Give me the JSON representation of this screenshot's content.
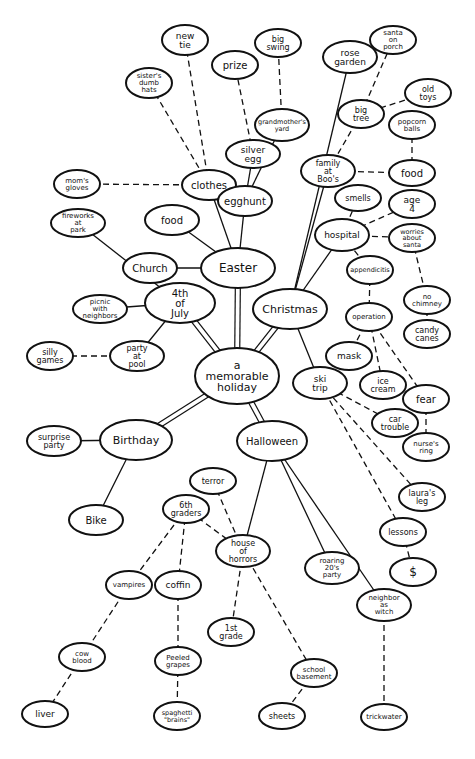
{
  "diagram": {
    "type": "mind-map",
    "center": "a memorable holiday",
    "nodes": [
      {
        "id": "center",
        "lines": [
          "a",
          "memorable",
          "holiday"
        ],
        "x": 237,
        "y": 376,
        "rx": 42,
        "ry": 28,
        "fs": 11
      },
      {
        "id": "easter",
        "lines": [
          "Easter"
        ],
        "x": 238,
        "y": 268,
        "rx": 37,
        "ry": 20,
        "fs": 12
      },
      {
        "id": "christmas",
        "lines": [
          "Christmas"
        ],
        "x": 290,
        "y": 309,
        "rx": 37,
        "ry": 20,
        "fs": 11
      },
      {
        "id": "july4",
        "lines": [
          "4th",
          "of",
          "July"
        ],
        "x": 180,
        "y": 303,
        "rx": 35,
        "ry": 20,
        "fs": 10
      },
      {
        "id": "birthday",
        "lines": [
          "Birthday"
        ],
        "x": 136,
        "y": 440,
        "rx": 36,
        "ry": 20,
        "fs": 11
      },
      {
        "id": "halloween",
        "lines": [
          "Halloween"
        ],
        "x": 272,
        "y": 441,
        "rx": 35,
        "ry": 20,
        "fs": 10
      },
      {
        "id": "clothes",
        "lines": [
          "clothes"
        ],
        "x": 209,
        "y": 185,
        "rx": 27,
        "ry": 15,
        "fs": 10
      },
      {
        "id": "egghunt",
        "lines": [
          "egghunt"
        ],
        "x": 245,
        "y": 201,
        "rx": 27,
        "ry": 15,
        "fs": 10
      },
      {
        "id": "food_e",
        "lines": [
          "food"
        ],
        "x": 172,
        "y": 220,
        "rx": 27,
        "ry": 15,
        "fs": 10
      },
      {
        "id": "church",
        "lines": [
          "Church"
        ],
        "x": 150,
        "y": 268,
        "rx": 27,
        "ry": 15,
        "fs": 10
      },
      {
        "id": "new_tie",
        "lines": [
          "new",
          "tie"
        ],
        "x": 185,
        "y": 40,
        "rx": 23,
        "ry": 15,
        "fs": 9
      },
      {
        "id": "sisters",
        "lines": [
          "sister's",
          "dumb",
          "hats"
        ],
        "x": 149,
        "y": 83,
        "rx": 23,
        "ry": 15,
        "fs": 7
      },
      {
        "id": "moms_gloves",
        "lines": [
          "mom's",
          "gloves"
        ],
        "x": 77,
        "y": 184,
        "rx": 23,
        "ry": 14,
        "fs": 7
      },
      {
        "id": "prize",
        "lines": [
          "prize"
        ],
        "x": 235,
        "y": 65,
        "rx": 23,
        "ry": 14,
        "fs": 10
      },
      {
        "id": "big_swing",
        "lines": [
          "big",
          "swing"
        ],
        "x": 278,
        "y": 43,
        "rx": 23,
        "ry": 14,
        "fs": 8
      },
      {
        "id": "grandmothers",
        "lines": [
          "grandmother's",
          "yard"
        ],
        "x": 282,
        "y": 125,
        "rx": 27,
        "ry": 16,
        "fs": 6.5
      },
      {
        "id": "silver_egg",
        "lines": [
          "silver",
          "egg"
        ],
        "x": 253,
        "y": 154,
        "rx": 27,
        "ry": 14,
        "fs": 9
      },
      {
        "id": "rose_garden",
        "lines": [
          "rose",
          "garden"
        ],
        "x": 350,
        "y": 57,
        "rx": 27,
        "ry": 16,
        "fs": 9
      },
      {
        "id": "santa_porch",
        "lines": [
          "santa",
          "on",
          "porch"
        ],
        "x": 393,
        "y": 40,
        "rx": 23,
        "ry": 14,
        "fs": 7
      },
      {
        "id": "old_toys",
        "lines": [
          "old",
          "toys"
        ],
        "x": 428,
        "y": 93,
        "rx": 23,
        "ry": 14,
        "fs": 8
      },
      {
        "id": "big_tree",
        "lines": [
          "big",
          "tree"
        ],
        "x": 361,
        "y": 114,
        "rx": 23,
        "ry": 14,
        "fs": 8
      },
      {
        "id": "popcorn",
        "lines": [
          "popcorn",
          "balls"
        ],
        "x": 412,
        "y": 125,
        "rx": 23,
        "ry": 14,
        "fs": 7
      },
      {
        "id": "family",
        "lines": [
          "family",
          "at",
          "Boo's"
        ],
        "x": 328,
        "y": 171,
        "rx": 27,
        "ry": 16,
        "fs": 8
      },
      {
        "id": "food_c",
        "lines": [
          "food"
        ],
        "x": 412,
        "y": 173,
        "rx": 23,
        "ry": 13,
        "fs": 10
      },
      {
        "id": "smells",
        "lines": [
          "smells"
        ],
        "x": 358,
        "y": 198,
        "rx": 23,
        "ry": 13,
        "fs": 8
      },
      {
        "id": "age4",
        "lines": [
          "age",
          "4"
        ],
        "x": 412,
        "y": 204,
        "rx": 23,
        "ry": 14,
        "fs": 9
      },
      {
        "id": "hospital",
        "lines": [
          "hospital"
        ],
        "x": 342,
        "y": 235,
        "rx": 27,
        "ry": 16,
        "fs": 9
      },
      {
        "id": "worries",
        "lines": [
          "worries",
          "about",
          "santa"
        ],
        "x": 412,
        "y": 238,
        "rx": 23,
        "ry": 14,
        "fs": 6.5
      },
      {
        "id": "appendicitis",
        "lines": [
          "appendicitis"
        ],
        "x": 370,
        "y": 270,
        "rx": 23,
        "ry": 14,
        "fs": 6.5
      },
      {
        "id": "no_chimney",
        "lines": [
          "no",
          "chimney"
        ],
        "x": 427,
        "y": 300,
        "rx": 23,
        "ry": 14,
        "fs": 7
      },
      {
        "id": "operation",
        "lines": [
          "operation"
        ],
        "x": 369,
        "y": 317,
        "rx": 23,
        "ry": 14,
        "fs": 7
      },
      {
        "id": "candy_canes",
        "lines": [
          "candy",
          "canes"
        ],
        "x": 427,
        "y": 334,
        "rx": 23,
        "ry": 14,
        "fs": 8
      },
      {
        "id": "mask",
        "lines": [
          "mask"
        ],
        "x": 349,
        "y": 356,
        "rx": 23,
        "ry": 14,
        "fs": 9
      },
      {
        "id": "ski_trip",
        "lines": [
          "ski",
          "trip"
        ],
        "x": 320,
        "y": 383,
        "rx": 27,
        "ry": 16,
        "fs": 9
      },
      {
        "id": "ice_cream",
        "lines": [
          "ice",
          "cream"
        ],
        "x": 383,
        "y": 385,
        "rx": 23,
        "ry": 14,
        "fs": 8
      },
      {
        "id": "fear",
        "lines": [
          "fear"
        ],
        "x": 426,
        "y": 399,
        "rx": 23,
        "ry": 14,
        "fs": 10
      },
      {
        "id": "car_trouble",
        "lines": [
          "car",
          "trouble"
        ],
        "x": 395,
        "y": 423,
        "rx": 23,
        "ry": 14,
        "fs": 8
      },
      {
        "id": "nurses_ring",
        "lines": [
          "nurse's",
          "ring"
        ],
        "x": 426,
        "y": 447,
        "rx": 23,
        "ry": 14,
        "fs": 7
      },
      {
        "id": "lauras_leg",
        "lines": [
          "laura's",
          "leg"
        ],
        "x": 422,
        "y": 497,
        "rx": 23,
        "ry": 14,
        "fs": 8
      },
      {
        "id": "lessons",
        "lines": [
          "lessons"
        ],
        "x": 403,
        "y": 532,
        "rx": 23,
        "ry": 14,
        "fs": 8
      },
      {
        "id": "dollar",
        "lines": [
          "$"
        ],
        "x": 413,
        "y": 572,
        "rx": 23,
        "ry": 14,
        "fs": 12
      },
      {
        "id": "fireworks",
        "lines": [
          "fireworks",
          "at",
          "park"
        ],
        "x": 78,
        "y": 223,
        "rx": 27,
        "ry": 14,
        "fs": 7
      },
      {
        "id": "picnic",
        "lines": [
          "picnic",
          "with",
          "neighbors"
        ],
        "x": 100,
        "y": 309,
        "rx": 27,
        "ry": 14,
        "fs": 7
      },
      {
        "id": "party_pool",
        "lines": [
          "party",
          "at",
          "pool"
        ],
        "x": 137,
        "y": 356,
        "rx": 27,
        "ry": 15,
        "fs": 8
      },
      {
        "id": "silly_games",
        "lines": [
          "silly",
          "games"
        ],
        "x": 50,
        "y": 356,
        "rx": 23,
        "ry": 14,
        "fs": 8
      },
      {
        "id": "surprise",
        "lines": [
          "surprise",
          "party"
        ],
        "x": 54,
        "y": 441,
        "rx": 27,
        "ry": 15,
        "fs": 8
      },
      {
        "id": "bike",
        "lines": [
          "Bike"
        ],
        "x": 96,
        "y": 520,
        "rx": 27,
        "ry": 15,
        "fs": 10
      },
      {
        "id": "terror",
        "lines": [
          "terror"
        ],
        "x": 213,
        "y": 481,
        "rx": 23,
        "ry": 13,
        "fs": 8
      },
      {
        "id": "sixth",
        "lines": [
          "6th",
          "graders"
        ],
        "x": 186,
        "y": 509,
        "rx": 23,
        "ry": 14,
        "fs": 8
      },
      {
        "id": "house_horrors",
        "lines": [
          "house",
          "of",
          "horrors"
        ],
        "x": 243,
        "y": 551,
        "rx": 27,
        "ry": 16,
        "fs": 8
      },
      {
        "id": "roaring",
        "lines": [
          "roaring",
          "20's",
          "party"
        ],
        "x": 332,
        "y": 568,
        "rx": 27,
        "ry": 16,
        "fs": 7
      },
      {
        "id": "vampires",
        "lines": [
          "vampires"
        ],
        "x": 129,
        "y": 585,
        "rx": 23,
        "ry": 14,
        "fs": 7
      },
      {
        "id": "coffin",
        "lines": [
          "coffin"
        ],
        "x": 178,
        "y": 585,
        "rx": 23,
        "ry": 14,
        "fs": 9
      },
      {
        "id": "neighbor",
        "lines": [
          "neighbor",
          "as",
          "witch"
        ],
        "x": 384,
        "y": 605,
        "rx": 27,
        "ry": 16,
        "fs": 7
      },
      {
        "id": "first_grade",
        "lines": [
          "1st",
          "grade"
        ],
        "x": 231,
        "y": 632,
        "rx": 23,
        "ry": 14,
        "fs": 8
      },
      {
        "id": "cow_blood",
        "lines": [
          "cow",
          "blood"
        ],
        "x": 82,
        "y": 657,
        "rx": 23,
        "ry": 14,
        "fs": 7
      },
      {
        "id": "peeled",
        "lines": [
          "Peeled",
          "grapes"
        ],
        "x": 178,
        "y": 661,
        "rx": 23,
        "ry": 14,
        "fs": 7
      },
      {
        "id": "school_base",
        "lines": [
          "school",
          "basement"
        ],
        "x": 314,
        "y": 673,
        "rx": 23,
        "ry": 14,
        "fs": 7
      },
      {
        "id": "liver",
        "lines": [
          "liver"
        ],
        "x": 45,
        "y": 714,
        "rx": 23,
        "ry": 13,
        "fs": 9
      },
      {
        "id": "spaghetti",
        "lines": [
          "spaghetti",
          "\"brains\""
        ],
        "x": 177,
        "y": 716,
        "rx": 23,
        "ry": 14,
        "fs": 6.5
      },
      {
        "id": "sheets",
        "lines": [
          "sheets"
        ],
        "x": 282,
        "y": 716,
        "rx": 23,
        "ry": 13,
        "fs": 8
      },
      {
        "id": "trickwater",
        "lines": [
          "trickwater"
        ],
        "x": 384,
        "y": 717,
        "rx": 23,
        "ry": 13,
        "fs": 7
      }
    ],
    "edges": [
      {
        "from": "center",
        "to": "easter",
        "style": "double"
      },
      {
        "from": "center",
        "to": "christmas",
        "style": "double"
      },
      {
        "from": "center",
        "to": "july4",
        "style": "double"
      },
      {
        "from": "center",
        "to": "birthday",
        "style": "double"
      },
      {
        "from": "center",
        "to": "halloween",
        "style": "double"
      },
      {
        "from": "easter",
        "to": "clothes",
        "style": "solid"
      },
      {
        "from": "easter",
        "to": "egghunt",
        "style": "solid"
      },
      {
        "from": "easter",
        "to": "food_e",
        "style": "solid"
      },
      {
        "from": "easter",
        "to": "church",
        "style": "solid"
      },
      {
        "from": "clothes",
        "to": "new_tie",
        "style": "dashed"
      },
      {
        "from": "clothes",
        "to": "sisters",
        "style": "dashed"
      },
      {
        "from": "clothes",
        "to": "moms_gloves",
        "style": "dashed"
      },
      {
        "from": "egghunt",
        "to": "silver_egg",
        "style": "solid"
      },
      {
        "from": "egghunt",
        "to": "grandmothers",
        "style": "solid"
      },
      {
        "from": "silver_egg",
        "to": "prize",
        "style": "dashed"
      },
      {
        "from": "grandmothers",
        "to": "big_swing",
        "style": "dashed"
      },
      {
        "from": "christmas",
        "to": "rose_garden",
        "style": "solid"
      },
      {
        "from": "christmas",
        "to": "family",
        "style": "solid"
      },
      {
        "from": "christmas",
        "to": "hospital",
        "style": "solid"
      },
      {
        "from": "christmas",
        "to": "ski_trip",
        "style": "solid"
      },
      {
        "from": "family",
        "to": "big_tree",
        "style": "dashed"
      },
      {
        "from": "family",
        "to": "food_c",
        "style": "dashed"
      },
      {
        "from": "big_tree",
        "to": "santa_porch",
        "style": "dashed"
      },
      {
        "from": "big_tree",
        "to": "old_toys",
        "style": "dashed"
      },
      {
        "from": "food_c",
        "to": "popcorn",
        "style": "dashed"
      },
      {
        "from": "hospital",
        "to": "smells",
        "style": "dashed"
      },
      {
        "from": "hospital",
        "to": "age4",
        "style": "dashed"
      },
      {
        "from": "hospital",
        "to": "worries",
        "style": "dashed"
      },
      {
        "from": "hospital",
        "to": "appendicitis",
        "style": "dashed"
      },
      {
        "from": "worries",
        "to": "no_chimney",
        "style": "dashed"
      },
      {
        "from": "no_chimney",
        "to": "candy_canes",
        "style": "dashed"
      },
      {
        "from": "appendicitis",
        "to": "operation",
        "style": "dashed"
      },
      {
        "from": "operation",
        "to": "mask",
        "style": "dashed"
      },
      {
        "from": "operation",
        "to": "ice_cream",
        "style": "dashed"
      },
      {
        "from": "operation",
        "to": "fear",
        "style": "dashed"
      },
      {
        "from": "fear",
        "to": "nurses_ring",
        "style": "dashed"
      },
      {
        "from": "ski_trip",
        "to": "car_trouble",
        "style": "dashed"
      },
      {
        "from": "ski_trip",
        "to": "lauras_leg",
        "style": "dashed"
      },
      {
        "from": "ski_trip",
        "to": "lessons",
        "style": "dashed"
      },
      {
        "from": "lessons",
        "to": "dollar",
        "style": "dashed"
      },
      {
        "from": "july4",
        "to": "fireworks",
        "style": "solid"
      },
      {
        "from": "july4",
        "to": "picnic",
        "style": "solid"
      },
      {
        "from": "july4",
        "to": "party_pool",
        "style": "solid"
      },
      {
        "from": "party_pool",
        "to": "silly_games",
        "style": "dashed"
      },
      {
        "from": "birthday",
        "to": "surprise",
        "style": "solid"
      },
      {
        "from": "birthday",
        "to": "bike",
        "style": "solid"
      },
      {
        "from": "halloween",
        "to": "house_horrors",
        "style": "solid"
      },
      {
        "from": "halloween",
        "to": "roaring",
        "style": "solid"
      },
      {
        "from": "halloween",
        "to": "neighbor",
        "style": "solid"
      },
      {
        "from": "house_horrors",
        "to": "terror",
        "style": "dashed"
      },
      {
        "from": "house_horrors",
        "to": "sixth",
        "style": "dashed"
      },
      {
        "from": "house_horrors",
        "to": "first_grade",
        "style": "dashed"
      },
      {
        "from": "house_horrors",
        "to": "school_base",
        "style": "dashed"
      },
      {
        "from": "sixth",
        "to": "vampires",
        "style": "dashed"
      },
      {
        "from": "sixth",
        "to": "coffin",
        "style": "dashed"
      },
      {
        "from": "vampires",
        "to": "cow_blood",
        "style": "dashed"
      },
      {
        "from": "cow_blood",
        "to": "liver",
        "style": "dashed"
      },
      {
        "from": "coffin",
        "to": "peeled",
        "style": "dashed"
      },
      {
        "from": "peeled",
        "to": "spaghetti",
        "style": "dashed"
      },
      {
        "from": "school_base",
        "to": "sheets",
        "style": "dashed"
      },
      {
        "from": "neighbor",
        "to": "trickwater",
        "style": "dashed"
      }
    ]
  }
}
